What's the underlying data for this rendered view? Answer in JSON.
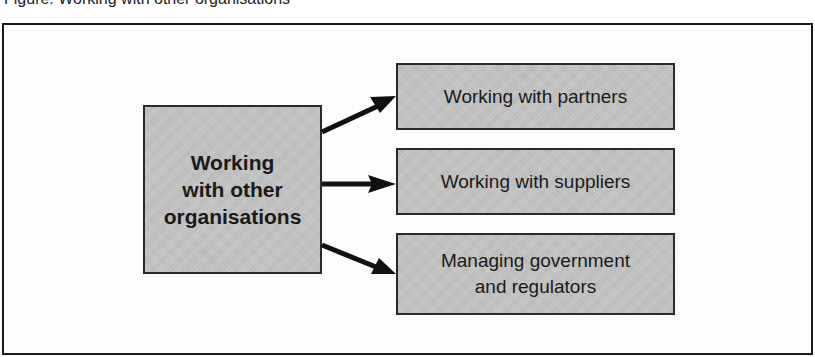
{
  "figure": {
    "caption_fragment": "Figure: Working with other organisations"
  },
  "diagram": {
    "source_node": {
      "label_lines": [
        "Working",
        "with other",
        "organisations"
      ]
    },
    "target_nodes": [
      {
        "label_lines": [
          "Working with partners"
        ]
      },
      {
        "label_lines": [
          "Working with suppliers"
        ]
      },
      {
        "label_lines": [
          "Managing government",
          "and regulators"
        ]
      }
    ],
    "edges": [
      {
        "from": "Working with other organisations",
        "to": "Working with partners"
      },
      {
        "from": "Working with other organisations",
        "to": "Working with suppliers"
      },
      {
        "from": "Working with other organisations",
        "to": "Managing government and regulators"
      }
    ],
    "colors": {
      "box_fill": "#c4c4c4",
      "box_border": "#2a2a2a",
      "arrow": "#111111",
      "frame": "#1a1a1a"
    }
  }
}
